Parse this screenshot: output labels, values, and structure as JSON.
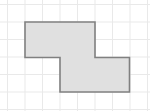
{
  "canvas": {
    "width": 150,
    "height": 111,
    "background_color": "#ffffff"
  },
  "grid": {
    "line_color": "#e9e9e9",
    "line_width": 1,
    "cell_size": 17.5,
    "origin_x": 7.5,
    "origin_y": 4.5,
    "vertical_lines": [
      7.5,
      25,
      42.5,
      60,
      77.5,
      95,
      112.5,
      130,
      147.5
    ],
    "horizontal_lines": [
      4.5,
      22,
      39.5,
      57,
      74.5,
      92,
      109.5
    ]
  },
  "shape": {
    "name": "z-hexomino-polygon",
    "type": "polygon",
    "fill_color": "#e0e0e0",
    "stroke_color": "#808080",
    "stroke_width": 1.6,
    "points": "25,22 95,22 95,57.5 129.5,57.5 129.5,92 60,92 60,57.5 25,57.5",
    "points_list": [
      [
        25,
        22
      ],
      [
        95,
        22
      ],
      [
        95,
        57.5
      ],
      [
        129.5,
        57.5
      ],
      [
        129.5,
        92
      ],
      [
        60,
        92
      ],
      [
        60,
        57.5
      ],
      [
        25,
        57.5
      ]
    ],
    "grid_cell_count": 12,
    "description": "Z-shaped (offset step) octagonal outline made of two overlapping rectangles"
  }
}
